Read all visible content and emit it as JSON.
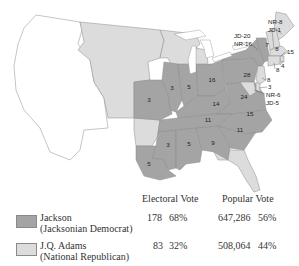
{
  "map": {
    "colors": {
      "jackson": "#a4a4a4",
      "adams": "#dcdcdc",
      "territory": "#ffffff",
      "border": "#6e6e6e"
    },
    "state_labels": [
      {
        "state": "Missouri",
        "value": "3"
      },
      {
        "state": "Illinois",
        "value": "3"
      },
      {
        "state": "Indiana",
        "value": "5"
      },
      {
        "state": "Ohio",
        "value": "16"
      },
      {
        "state": "Pennsylvania",
        "value": "28"
      },
      {
        "state": "Kentucky",
        "value": "14"
      },
      {
        "state": "Virginia",
        "value": "24"
      },
      {
        "state": "Tennessee",
        "value": "11"
      },
      {
        "state": "North Carolina",
        "value": "15"
      },
      {
        "state": "South Carolina",
        "value": "11"
      },
      {
        "state": "Mississippi",
        "value": "3"
      },
      {
        "state": "Alabama",
        "value": "5"
      },
      {
        "state": "Georgia",
        "value": "9"
      },
      {
        "state": "Louisiana",
        "value": "5"
      },
      {
        "state": "Vermont",
        "value": "7"
      },
      {
        "state": "New Hampshire",
        "value": "8"
      },
      {
        "state": "Massachusetts",
        "value": "15"
      },
      {
        "state": "Rhode Island",
        "value": "4"
      },
      {
        "state": "Connecticut",
        "value": "8"
      },
      {
        "state": "New Jersey",
        "value": "8"
      },
      {
        "state": "Delaware",
        "value": "3"
      }
    ],
    "split_labels": {
      "maine": [
        "NR-8",
        "JD-1"
      ],
      "new_york": [
        "JD-20",
        "NR-16"
      ],
      "maryland": [
        "NR-6",
        "JD-5"
      ]
    }
  },
  "legend": {
    "headers": {
      "electoral": "Electoral Vote",
      "popular": "Popular Vote"
    },
    "rows": [
      {
        "candidate": "Jackson",
        "party": "(Jacksonian Democrat)",
        "electoral_votes": "178",
        "electoral_pct": "68%",
        "popular_votes": "647,286",
        "popular_pct": "56%",
        "color": "#a4a4a4"
      },
      {
        "candidate": "J.Q. Adams",
        "party": "(National Republican)",
        "electoral_votes": "83",
        "electoral_pct": "32%",
        "popular_votes": "508,064",
        "popular_pct": "44%",
        "color": "#dcdcdc"
      }
    ]
  }
}
